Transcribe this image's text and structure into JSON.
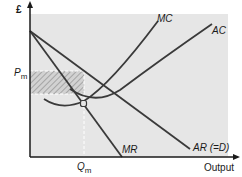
{
  "diagram": {
    "y_axis_label": "£",
    "x_axis_label": "Output",
    "price_label": "P",
    "price_subscript": "m",
    "quantity_label": "Q",
    "quantity_subscript": "m",
    "curves": {
      "mc": "MC",
      "ac": "AC",
      "mr": "MR",
      "ar": "AR (=D)"
    },
    "colors": {
      "plot_bg": "#e6e6e6",
      "line": "#3a3a3a",
      "hatch": "#9a9a9a",
      "dashed": "#ffffff"
    },
    "annotations": {
      "shaded_area": "supernormal profit",
      "marker": "MC = MR intersection"
    }
  }
}
